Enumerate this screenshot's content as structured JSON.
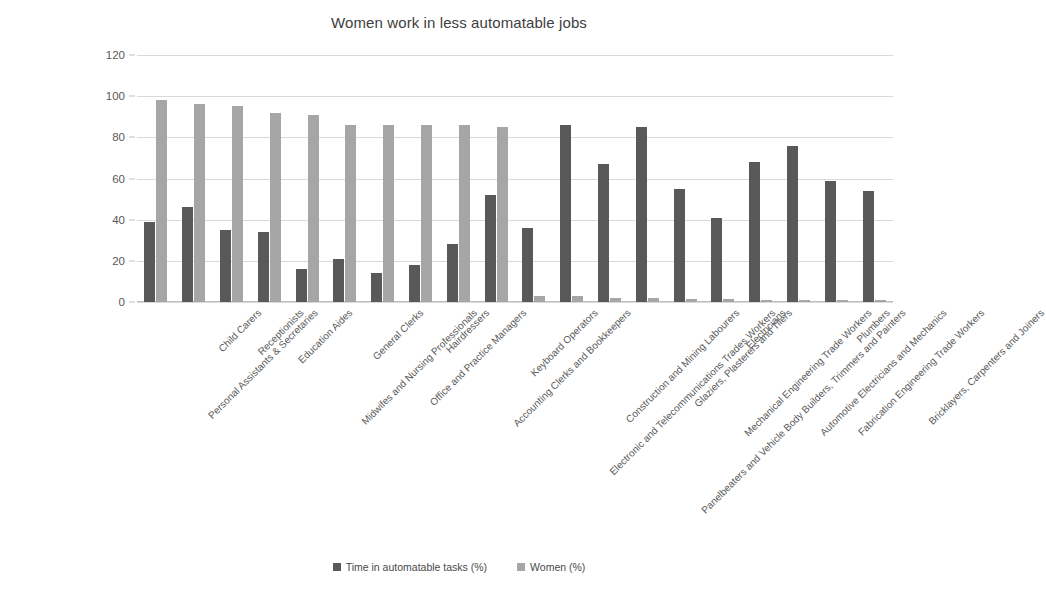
{
  "chart_data": {
    "type": "bar",
    "title": "Women work in less automatable jobs",
    "xlabel": "",
    "ylabel": "",
    "ylim": [
      0,
      120
    ],
    "yticks": [
      0,
      20,
      40,
      60,
      80,
      100,
      120
    ],
    "grid": true,
    "legend_position": "bottom",
    "categories": [
      "Personal Assistants & Secretaries",
      "Child Carers",
      "Receptionists",
      "Education Aides",
      "Midwifes and Nursing Professionals",
      "General Clerks",
      "Office and Practice Managers",
      "Hairdressers",
      "Accounting Clerks and Bookkeepers",
      "Keyboard Operators",
      "Electronic and Telecommunications Trades Workers",
      "Construction and Mining Labourers",
      "Panelbeaters and Vehicle Body Builders, Trimmers and Painters",
      "Glaziers, Plasterers and Tilers",
      "Mechanical Engineering Trade Workers",
      "Electricians",
      "Automotive Electricians and Mechanics",
      "Fabrication Engineering Trade Workers",
      "Plumbers",
      "Bricklayers, Carpenters and Joiners"
    ],
    "series": [
      {
        "name": "Time in automatable tasks (%)",
        "color": "#595959",
        "values": [
          39,
          46,
          35,
          34,
          16,
          21,
          14,
          18,
          28,
          52,
          36,
          86,
          67,
          85,
          55,
          41,
          68,
          76,
          59,
          54
        ]
      },
      {
        "name": "Women (%)",
        "color": "#a6a6a6",
        "values": [
          98,
          96,
          95,
          92,
          91,
          86,
          86,
          86,
          86,
          85,
          3,
          3,
          2,
          2,
          1.5,
          1.5,
          1,
          1,
          1,
          1
        ]
      }
    ]
  },
  "legend": {
    "items": [
      {
        "label": "Time in automatable tasks (%)",
        "swatch": "dark"
      },
      {
        "label": "Women (%)",
        "swatch": "light"
      }
    ]
  }
}
